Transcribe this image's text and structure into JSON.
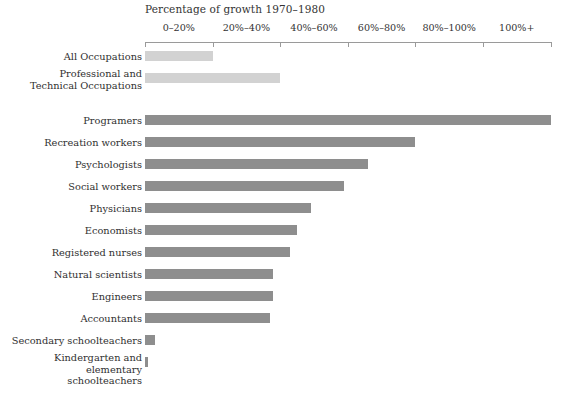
{
  "chart_data": {
    "type": "bar",
    "orientation": "horizontal",
    "title": "Percentage of growth 1970–1980",
    "xlabel": "",
    "ylabel": "",
    "xlim": [
      0,
      120
    ],
    "grid": false,
    "legend": null,
    "tick_labels": [
      "0–20%",
      "20%–40%",
      "40%–60%",
      "60%–80%",
      "80%–100%",
      "100%+"
    ],
    "tick_values": [
      0,
      20,
      40,
      60,
      80,
      100,
      120
    ],
    "categories": [
      "All Occupations",
      "Professional and\nTechnical Occupations",
      "Programers",
      "Recreation workers",
      "Psychologists",
      "Social workers",
      "Physicians",
      "Economists",
      "Registered nurses",
      "Natural scientists",
      "Engineers",
      "Accountants",
      "Secondary schoolteachers",
      "Kindergarten and elementary\nschoolteachers"
    ],
    "values": [
      20,
      40,
      120,
      80,
      66,
      59,
      49,
      45,
      43,
      38,
      38,
      37,
      3,
      1
    ],
    "series": [
      {
        "name": "Percentage of growth 1970–1980",
        "values": [
          20,
          40,
          120,
          80,
          66,
          59,
          49,
          45,
          43,
          38,
          38,
          37,
          3,
          1
        ]
      }
    ],
    "colors": {
      "summary_bar": "#d2d2d2",
      "occupation_bar": "#8e8e8e",
      "axis": "#9a9a9a",
      "text": "#2f2f2f",
      "background": "#ffffff"
    }
  },
  "rows": [
    {
      "label": "All Occupations",
      "value": 20,
      "group": "summary",
      "lines": 1
    },
    {
      "label": "Professional and\nTechnical Occupations",
      "value": 40,
      "group": "summary",
      "lines": 2
    },
    {
      "label": "Programers",
      "value": 120,
      "group": "occupation",
      "lines": 1
    },
    {
      "label": "Recreation workers",
      "value": 80,
      "group": "occupation",
      "lines": 1
    },
    {
      "label": "Psychologists",
      "value": 66,
      "group": "occupation",
      "lines": 1
    },
    {
      "label": "Social workers",
      "value": 59,
      "group": "occupation",
      "lines": 1
    },
    {
      "label": "Physicians",
      "value": 49,
      "group": "occupation",
      "lines": 1
    },
    {
      "label": "Economists",
      "value": 45,
      "group": "occupation",
      "lines": 1
    },
    {
      "label": "Registered nurses",
      "value": 43,
      "group": "occupation",
      "lines": 1
    },
    {
      "label": "Natural scientists",
      "value": 38,
      "group": "occupation",
      "lines": 1
    },
    {
      "label": "Engineers",
      "value": 38,
      "group": "occupation",
      "lines": 1
    },
    {
      "label": "Accountants",
      "value": 37,
      "group": "occupation",
      "lines": 1
    },
    {
      "label": "Secondary schoolteachers",
      "value": 3,
      "group": "occupation",
      "lines": 1
    },
    {
      "label": "Kindergarten and elementary\nschoolteachers",
      "value": 1,
      "group": "occupation",
      "lines": 2
    }
  ]
}
